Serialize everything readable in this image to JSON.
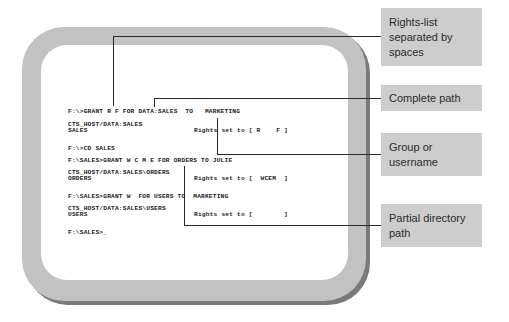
{
  "terminal": {
    "lines": [
      {
        "text": "F:\\>GRANT R F FOR DATA:SALES  TO   MARKETING",
        "y": 109
      },
      {
        "text": "CTS_HOST/DATA:SALES",
        "y": 122
      },
      {
        "text": "SALES",
        "y": 128
      },
      {
        "text": "Rights set to [ R    F ]",
        "y": 128,
        "x": 194
      },
      {
        "text": "F:\\>CD SALES",
        "y": 146
      },
      {
        "text": "F:\\SALES>GRANT W C M E FOR ORDERS TO JULIE",
        "y": 158
      },
      {
        "text": "CTS_HOST/DATA:SALES\\ORDERS",
        "y": 170
      },
      {
        "text": "ORDERS",
        "y": 176
      },
      {
        "text": "Rights set to [  WCEM  ]",
        "y": 176,
        "x": 194
      },
      {
        "text": "F:\\SALES>GRANT W  FOR USERS TO  MARKETING",
        "y": 194
      },
      {
        "text": "CTS_HOST/DATA:SALES\\USERS",
        "y": 206
      },
      {
        "text": "USERS",
        "y": 212
      },
      {
        "text": "Rights set to [        ]",
        "y": 212,
        "x": 194
      },
      {
        "text": "F:\\SALES>_",
        "y": 230
      }
    ]
  },
  "callouts": [
    {
      "label": "Rights-list separated by spaces"
    },
    {
      "label": "Complete path"
    },
    {
      "label": "Group or username"
    },
    {
      "label": "Partial directory path"
    }
  ],
  "colors": {
    "frame": "#c2c2c2",
    "frame_shadow": "#7a7a7a",
    "callout_bg": "#cdcdcd",
    "leader_line": "#2a2a2a"
  }
}
